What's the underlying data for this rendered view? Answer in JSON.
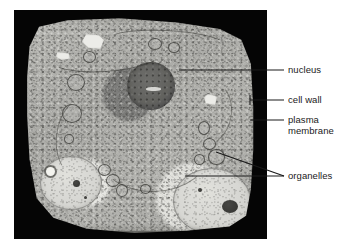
{
  "figure": {
    "type": "labeled-micrograph",
    "background_color": "#ffffff",
    "plate_color": "#050505"
  },
  "labels": [
    {
      "id": "nucleus",
      "text": "nucleus",
      "leader": {
        "from_x": 179,
        "from_y": 70,
        "to_x": 284,
        "to_y": 70
      }
    },
    {
      "id": "cell-wall",
      "text": "cell wall",
      "leader": {
        "from_x": 250,
        "from_y": 100,
        "to_x": 284,
        "to_y": 100
      }
    },
    {
      "id": "plasma-membrane",
      "text_line1": "plasma",
      "text_line2": "membrane",
      "leader": {
        "from_x": 250,
        "from_y": 120,
        "to_x": 284,
        "to_y": 120
      }
    },
    {
      "id": "organelles",
      "text": "organelles",
      "leader_a": {
        "from_x": 216,
        "from_y": 152,
        "to_x": 284,
        "to_y": 176
      },
      "leader_b": {
        "from_x": 185,
        "from_y": 176,
        "to_x": 284,
        "to_y": 176
      }
    }
  ],
  "structures": {
    "nucleus_label": "nucleus",
    "cell_wall_label": "cell wall",
    "plasma_membrane_label": "plasma membrane",
    "organelles_label": "organelles"
  },
  "colors": {
    "text": "#1a1a1a",
    "leader_line": "#1a1a1a",
    "plate": "#050505",
    "cytoplasm": "#b0b0ac",
    "nucleus": "#636360",
    "vacuole": "#d8d8d4"
  }
}
